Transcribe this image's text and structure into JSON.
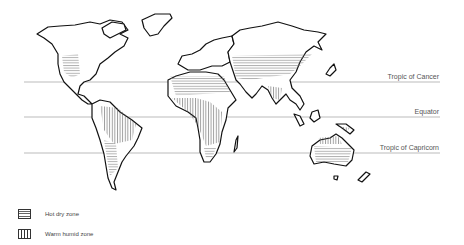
{
  "diagram": {
    "type": "world map of climate zones",
    "reference_lines": [
      {
        "label": "Tropic of Cancer",
        "y": 82
      },
      {
        "label": "Equator",
        "y": 117
      },
      {
        "label": "Tropic of Capricorn",
        "y": 153
      }
    ],
    "legend": [
      {
        "pattern": "horizontal-lines",
        "label": "Hot dry zone"
      },
      {
        "pattern": "vertical-lines",
        "label": "Warm humid zone"
      }
    ],
    "colors": {
      "outline": "#111111",
      "lines": "#999999",
      "text": "#555555"
    }
  }
}
